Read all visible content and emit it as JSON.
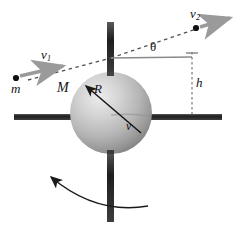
{
  "figure": {
    "background_color": "#ffffff"
  },
  "labels": {
    "incoming_velocity": "v",
    "incoming_velocity_sub": "1",
    "outgoing_velocity": "v",
    "outgoing_velocity_sub": "2",
    "point_mass": "m",
    "sphere_mass": "M",
    "radius": "R",
    "sphere_velocity": "v",
    "impact_height": "h",
    "angle": "θ"
  },
  "colors": {
    "sphere_light": "#e2e2e2",
    "sphere_mid": "#b8b8b8",
    "sphere_dark": "#7d7d7d",
    "axle": "#2b2b2b",
    "arrow_gray": "#9a9a9a",
    "dashed_line": "#555555",
    "reference_line": "#8a8a8a",
    "text": "#111111"
  },
  "geometry": {
    "sphere_center_x": 111,
    "sphere_center_y": 113,
    "sphere_radius": 41,
    "mass_dot_x": 16,
    "mass_dot_y": 78,
    "outgoing_dot_x": 196,
    "outgoing_dot_y": 28,
    "impact_point_x": 111,
    "impact_point_y": 58,
    "horizontal_axis_y": 117,
    "height_line_x": 192
  },
  "elements": {
    "sphere_name": "rotating-sphere",
    "vertical_axle_name": "vertical-axle",
    "horizontal_axle_name": "horizontal-axle",
    "trajectory_name": "particle-trajectory",
    "rotation_arrow_name": "rotation-direction-arrow",
    "radius_arrow_name": "radius-indicator",
    "height_indicator_name": "impact-height-indicator",
    "reference_line_name": "horizontal-reference-line"
  }
}
